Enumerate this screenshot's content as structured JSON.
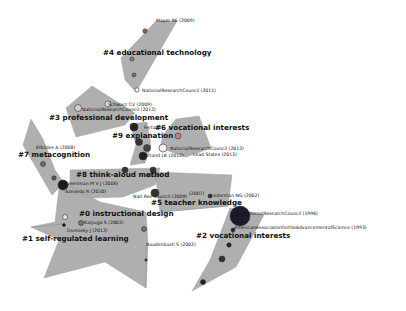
{
  "diagram": {
    "type": "co-citation cluster network",
    "background": "#ffffff",
    "cluster_fill": "#a9a9a9",
    "clusters": [
      {
        "id": "0",
        "label": "#0 instructional design",
        "x": 79,
        "y": 216
      },
      {
        "id": "1",
        "label": "#1 self-regulated learning",
        "x": 22,
        "y": 241
      },
      {
        "id": "2",
        "label": "#2 vocational interests",
        "x": 196,
        "y": 238
      },
      {
        "id": "3",
        "label": "#3 professional development",
        "x": 49,
        "y": 120
      },
      {
        "id": "4",
        "label": "#4 educational technology",
        "x": 103,
        "y": 55
      },
      {
        "id": "5",
        "label": "#5 teacher knowledge",
        "x": 151,
        "y": 205
      },
      {
        "id": "6",
        "label": "#6 vocational interests",
        "x": 155,
        "y": 130
      },
      {
        "id": "7",
        "label": "#7 metacognition",
        "x": 18,
        "y": 157
      },
      {
        "id": "8",
        "label": "#8 think-aloud method",
        "x": 76,
        "y": 177
      },
      {
        "id": "9",
        "label": "#9 explanation",
        "x": 112,
        "y": 138
      }
    ],
    "references": [
      {
        "label": "Mayer RE (2009)",
        "x": 156,
        "y": 22
      },
      {
        "label": "NationalResearchCouncil (2011)",
        "x": 142,
        "y": 92
      },
      {
        "label": "Schwarz CV (2009)",
        "x": 108,
        "y": 106
      },
      {
        "label": "NationalResearchCouncil (2012)",
        "x": 82,
        "y": 111
      },
      {
        "label": "Ferland",
        "x": 144,
        "y": 129
      },
      {
        "label": "NationalResearchCouncil (2012)",
        "x": 170,
        "y": 150
      },
      {
        "label": "Ferland LK (2012)",
        "x": 143,
        "y": 157
      },
      {
        "label": "Lead States (2013)",
        "x": 193,
        "y": 156
      },
      {
        "label": "Efklides A (2008)",
        "x": 36,
        "y": 149
      },
      {
        "label": "(2010)",
        "x": 146,
        "y": 177
      },
      {
        "label": "Veenman M V J (2006)",
        "x": 67,
        "y": 185
      },
      {
        "label": "Azevedo R (2010)",
        "x": 65,
        "y": 193
      },
      {
        "label": "Natl Res Council (2009)",
        "x": 133,
        "y": 198
      },
      {
        "label": "(2007)",
        "x": 189,
        "y": 195
      },
      {
        "label": "Lederman NG (2002)",
        "x": 211,
        "y": 197
      },
      {
        "label": "NationalResearchCouncil (1996)",
        "x": 244,
        "y": 215
      },
      {
        "label": "AmericanAssociationfortheAdvancementofScience (1993)",
        "x": 234,
        "y": 229
      },
      {
        "label": "Kalyuga S (2003)",
        "x": 84,
        "y": 224
      },
      {
        "label": "Dunlosky J (2012)",
        "x": 67,
        "y": 232
      },
      {
        "label": "Raudenbush S (2002)",
        "x": 146,
        "y": 246
      }
    ]
  }
}
